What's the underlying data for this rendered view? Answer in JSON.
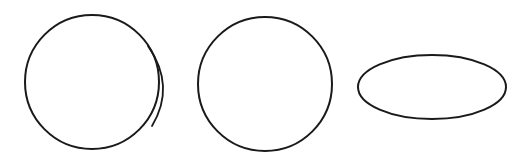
{
  "figure": {
    "background": "#ffffff",
    "stroke_color": "#1a1a1a",
    "shapes": [
      {
        "name": "circle-with-highlight-arc",
        "type": "circle",
        "cx": 92,
        "cy": 82,
        "r": 67,
        "stroke_width": 2,
        "extra_arc": {
          "path": "M 148 46 Q 176 86 152 126",
          "stroke_width": 1.8
        }
      },
      {
        "name": "plain-circle",
        "type": "circle",
        "cx": 265,
        "cy": 84,
        "r": 67,
        "stroke_width": 2
      },
      {
        "name": "flattened-ellipse",
        "type": "ellipse",
        "cx": 432,
        "cy": 87,
        "rx": 74,
        "ry": 32,
        "stroke_width": 2
      }
    ]
  }
}
